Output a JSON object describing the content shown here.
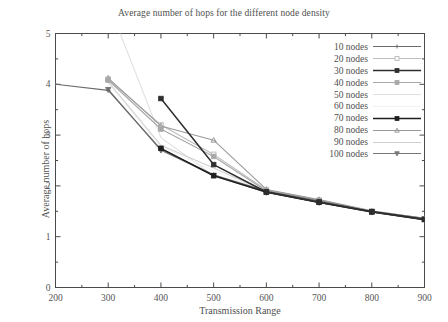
{
  "chart_data": {
    "type": "line",
    "title": "Average number of hops for the different node density",
    "xlabel": "Transmission Range",
    "ylabel": "Average number of hops",
    "xlim": [
      200,
      900
    ],
    "ylim": [
      0,
      5
    ],
    "xticks": [
      200,
      300,
      400,
      500,
      600,
      700,
      800,
      900
    ],
    "yticks": [
      0,
      1,
      2,
      3,
      4,
      5
    ],
    "xtick_labels": [
      "200",
      "300",
      "400",
      "500",
      "600",
      "700",
      "800",
      "900"
    ],
    "ytick_labels": [
      "0",
      "1",
      "2",
      "3",
      "4",
      "5"
    ],
    "grid": false,
    "minor_ticks": true,
    "legend_position": "top-right",
    "series": [
      {
        "name": "10 nodes",
        "color": "#6b6b6b",
        "marker": "plus",
        "x": [
          200,
          300,
          400,
          500,
          600,
          700,
          800,
          900
        ],
        "values": [
          4.0,
          3.88,
          2.72,
          2.22,
          1.9,
          1.7,
          1.5,
          1.36
        ]
      },
      {
        "name": "20 nodes",
        "color": "#bdbdbd",
        "marker": "square-open",
        "x": [
          300,
          400,
          500,
          600,
          700,
          800,
          900
        ],
        "values": [
          4.1,
          3.2,
          2.62,
          1.92,
          1.72,
          1.5,
          1.35
        ]
      },
      {
        "name": "30 nodes",
        "color": "#2e2e2e",
        "marker": "square-filled",
        "x": [
          400,
          500,
          600,
          700,
          800,
          900
        ],
        "values": [
          3.72,
          2.42,
          1.88,
          1.68,
          1.49,
          1.34
        ]
      },
      {
        "name": "40 nodes",
        "color": "#a8a8a8",
        "marker": "square-filled",
        "x": [
          300,
          400,
          500,
          600,
          700,
          800,
          900
        ],
        "values": [
          4.08,
          3.12,
          2.58,
          1.9,
          1.71,
          1.5,
          1.35
        ]
      },
      {
        "name": "50 nodes",
        "color": "#e0e0e0",
        "marker": "none",
        "x": [
          300,
          400,
          500,
          600,
          700,
          800,
          900
        ],
        "values": [
          5.6,
          2.95,
          2.2,
          1.87,
          1.68,
          1.48,
          1.33
        ]
      },
      {
        "name": "60 nodes",
        "color": "#f2f2f2",
        "marker": "none",
        "x": [
          300,
          400,
          500,
          600,
          700,
          800,
          900
        ],
        "values": [
          4.02,
          2.78,
          2.3,
          1.88,
          1.69,
          1.49,
          1.34
        ]
      },
      {
        "name": "70 nodes",
        "color": "#1f1f1f",
        "marker": "square-filled",
        "x": [
          400,
          500,
          600,
          700,
          800,
          900
        ],
        "values": [
          2.74,
          2.2,
          1.88,
          1.68,
          1.49,
          1.34
        ]
      },
      {
        "name": "80 nodes",
        "color": "#9a9a9a",
        "marker": "triangle-up",
        "x": [
          300,
          400,
          500,
          600,
          700,
          800,
          900
        ],
        "values": [
          4.12,
          3.18,
          2.9,
          1.93,
          1.73,
          1.51,
          1.36
        ]
      },
      {
        "name": "90 nodes",
        "color": "#cfcfcf",
        "marker": "none",
        "x": [
          300,
          400,
          500,
          600,
          700,
          800,
          900
        ],
        "values": [
          4.05,
          2.8,
          2.35,
          1.89,
          1.7,
          1.49,
          1.35
        ]
      },
      {
        "name": "100 nodes",
        "color": "#777777",
        "marker": "triangle-down",
        "x": [
          300,
          400,
          500,
          600,
          700,
          800,
          900
        ],
        "values": [
          3.9,
          2.7,
          2.21,
          1.87,
          1.67,
          1.48,
          1.33
        ]
      }
    ]
  },
  "legend": {
    "entries": [
      "10 nodes",
      "20 nodes",
      "30 nodes",
      "40 nodes",
      "50 nodes",
      "60 nodes",
      "70 nodes",
      "80 nodes",
      "90 nodes",
      "100 nodes"
    ]
  }
}
